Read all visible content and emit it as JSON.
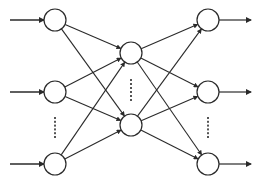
{
  "diagram": {
    "type": "feedforward-neural-network",
    "stroke_color": "#2a2a2a",
    "fill_color": "#ffffff",
    "node_radius": 11,
    "layers": [
      {
        "name": "input",
        "x": 55,
        "nodes": [
          20,
          92,
          164
        ],
        "ellipsis": {
          "y_start": 118,
          "y_end": 137
        }
      },
      {
        "name": "hidden",
        "x": 131,
        "nodes": [
          53,
          125
        ],
        "ellipsis": {
          "y_start": 80,
          "y_end": 100
        }
      },
      {
        "name": "output",
        "x": 208,
        "nodes": [
          20,
          92,
          164
        ],
        "ellipsis": {
          "y_start": 118,
          "y_end": 137
        }
      }
    ],
    "input_arrows": {
      "x_start": 10,
      "x_end": 44
    },
    "output_arrows": {
      "x_start": 219,
      "x_end": 251
    }
  }
}
